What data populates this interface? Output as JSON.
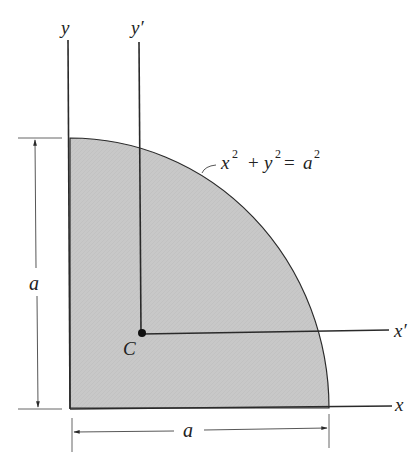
{
  "figure": {
    "colors": {
      "fill": "#c9c9c9",
      "line": "#2a2a2a",
      "background": "#ffffff"
    },
    "labels": {
      "y_axis": "y",
      "y_prime_axis": "y′",
      "x_axis": "x",
      "x_prime_axis": "x′",
      "centroid": "C",
      "height_dimension": "a",
      "width_dimension": "a",
      "equation_x": "x",
      "equation_exp1": "2",
      "equation_plus": "+",
      "equation_y": "y",
      "equation_exp2": "2",
      "equation_eq": "=",
      "equation_a": "a",
      "equation_exp3": "2"
    },
    "equation_full": "x² + y² = a²"
  }
}
